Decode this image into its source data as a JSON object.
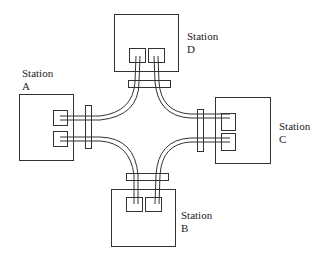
{
  "diagram": {
    "type": "network topology",
    "stations": [
      {
        "id": "A",
        "label_line1": "Station",
        "label_line2": "A"
      },
      {
        "id": "B",
        "label_line1": "Station",
        "label_line2": "B"
      },
      {
        "id": "C",
        "label_line1": "Station",
        "label_line2": "C"
      },
      {
        "id": "D",
        "label_line1": "Station",
        "label_line2": "D"
      }
    ],
    "connections": [
      {
        "from": "A",
        "to": "D"
      },
      {
        "from": "D",
        "to": "C"
      },
      {
        "from": "C",
        "to": "B"
      },
      {
        "from": "B",
        "to": "A"
      }
    ],
    "colors": {
      "stroke": "#333333",
      "background": "#ffffff"
    }
  }
}
